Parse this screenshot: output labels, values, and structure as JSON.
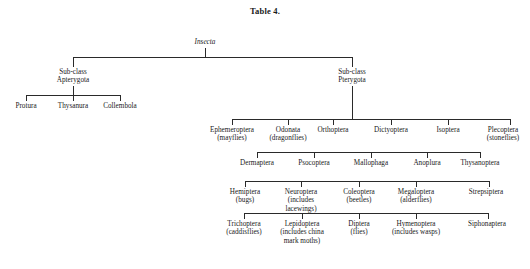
{
  "title": "Table 4.",
  "root": {
    "name": "Insecta",
    "italic": true
  },
  "subclasses": [
    {
      "line1": "Sub-class",
      "line2": "Apterygota"
    },
    {
      "line1": "Sub-class",
      "line2": "Pterygota"
    }
  ],
  "apterygota_orders": [
    {
      "name": "Protura",
      "common": ""
    },
    {
      "name": "Thysanura",
      "common": ""
    },
    {
      "name": "Collembola",
      "common": ""
    }
  ],
  "pterygota_rows": [
    {
      "row": 1,
      "orders": [
        {
          "name": "Ephemeroptera",
          "common": "(mayflies)"
        },
        {
          "name": "Odonata",
          "common": "(dragonflies)"
        },
        {
          "name": "Orthoptera",
          "common": ""
        },
        {
          "name": "Dictyoptera",
          "common": ""
        },
        {
          "name": "Isoptera",
          "common": ""
        },
        {
          "name": "Plecoptera",
          "common": "(stoneflies)"
        }
      ]
    },
    {
      "row": 2,
      "orders": [
        {
          "name": "Dermaptera",
          "common": ""
        },
        {
          "name": "Psocoptera",
          "common": ""
        },
        {
          "name": "Mallophaga",
          "common": ""
        },
        {
          "name": "Anoplura",
          "common": ""
        },
        {
          "name": "Thysanoptera",
          "common": ""
        }
      ]
    },
    {
      "row": 3,
      "orders": [
        {
          "name": "Hemiptera",
          "common": "(bugs)"
        },
        {
          "name": "Neuroptera",
          "common": "(includes lacewings)"
        },
        {
          "name": "Coleoptera",
          "common": "(beetles)"
        },
        {
          "name": "Megaloptera",
          "common": "(alderflies)"
        },
        {
          "name": "Strepsiptera",
          "common": ""
        }
      ]
    },
    {
      "row": 4,
      "orders": [
        {
          "name": "Trichoptera",
          "common": "(caddisflies)"
        },
        {
          "name": "Lepidoptera",
          "common": "(includes china mark moths)"
        },
        {
          "name": "Diptera",
          "common": "(flies)"
        },
        {
          "name": "Hymenoptera",
          "common": "(includes wasps)"
        },
        {
          "name": "Siphonaptera",
          "common": ""
        }
      ]
    }
  ],
  "colors": {
    "line": "#2a2a2a",
    "text": "#1a1a1a",
    "background": "#ffffff"
  }
}
